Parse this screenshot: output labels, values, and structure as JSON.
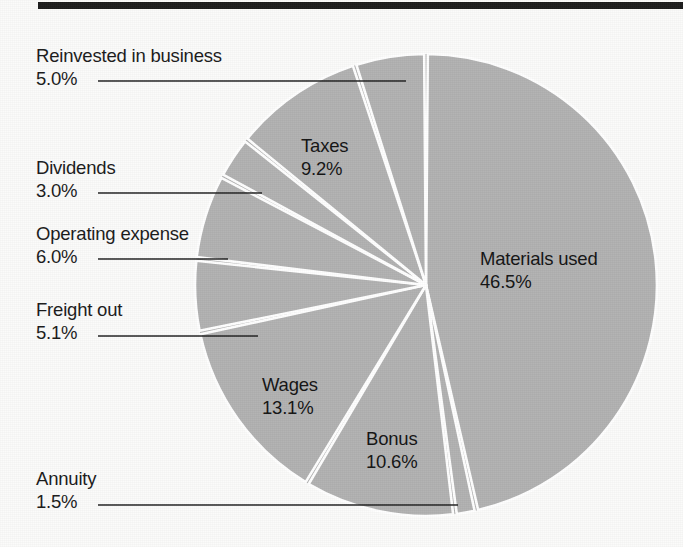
{
  "figure": {
    "background_color": "#fbfbfa",
    "rule_color": "#1c1c1c",
    "slice_color": "#b2b2b2",
    "slice_edge_color": "#ffffff",
    "text_color": "#1a1a1a",
    "leader_color": "#222222"
  },
  "chart_data": {
    "type": "pie",
    "title": "",
    "subtitle": "",
    "xlabel": "",
    "ylabel": "",
    "legend_position": "none",
    "grid": false,
    "units": "percent",
    "total": 100.0,
    "start_angle_deg": 0,
    "direction": "clockwise",
    "categories": [
      "Materials used",
      "Annuity",
      "Bonus",
      "Wages",
      "Freight out",
      "Operating expense",
      "Dividends",
      "Taxes",
      "Reinvested in business"
    ],
    "values": [
      46.5,
      1.5,
      10.6,
      13.1,
      5.1,
      6.0,
      3.0,
      9.2,
      5.0
    ],
    "slices": [
      {
        "label": "Materials used",
        "value": 46.5,
        "pct_text": "46.5%",
        "label_placement": "inside"
      },
      {
        "label": "Annuity",
        "value": 1.5,
        "pct_text": "1.5%",
        "label_placement": "callout"
      },
      {
        "label": "Bonus",
        "value": 10.6,
        "pct_text": "10.6%",
        "label_placement": "inside"
      },
      {
        "label": "Wages",
        "value": 13.1,
        "pct_text": "13.1%",
        "label_placement": "inside"
      },
      {
        "label": "Freight out",
        "value": 5.1,
        "pct_text": "5.1%",
        "label_placement": "callout"
      },
      {
        "label": "Operating expense",
        "value": 6.0,
        "pct_text": "6.0%",
        "label_placement": "callout"
      },
      {
        "label": "Dividends",
        "value": 3.0,
        "pct_text": "3.0%",
        "label_placement": "callout"
      },
      {
        "label": "Taxes",
        "value": 9.2,
        "pct_text": "9.2%",
        "label_placement": "inside"
      },
      {
        "label": "Reinvested in business",
        "value": 5.0,
        "pct_text": "5.0%",
        "label_placement": "callout"
      }
    ]
  },
  "callouts": {
    "reinvested": {
      "name": "Reinvested in business",
      "pct": "5.0%"
    },
    "dividends": {
      "name": "Dividends",
      "pct": "3.0%"
    },
    "operating": {
      "name": "Operating expense",
      "pct": "6.0%"
    },
    "freight": {
      "name": "Freight out",
      "pct": "5.1%"
    },
    "annuity": {
      "name": "Annuity",
      "pct": "1.5%"
    }
  },
  "inside_labels": {
    "taxes": {
      "name": "Taxes",
      "pct": "9.2%"
    },
    "materials": {
      "name": "Materials used",
      "pct": "46.5%"
    },
    "wages": {
      "name": "Wages",
      "pct": "13.1%"
    },
    "bonus": {
      "name": "Bonus",
      "pct": "10.6%"
    }
  }
}
